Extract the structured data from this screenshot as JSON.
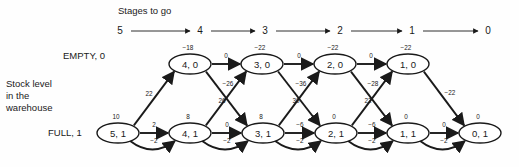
{
  "diagram": {
    "title": "Stages to go",
    "background_color": "#fefefe",
    "ink_color": "#1a1a1a",
    "row_labels": {
      "top": "EMPTY, 0",
      "bottom": "FULL, 1",
      "axis_caption_line1": "Stock level",
      "axis_caption_line2": "in the",
      "axis_caption_line3": "warehouse"
    },
    "stage_scale": {
      "label": "Stages to go",
      "ticks": [
        "5",
        "4",
        "3",
        "2",
        "1",
        "0"
      ],
      "tick_x": [
        120,
        200,
        265,
        340,
        412,
        488
      ],
      "y": 31,
      "arrows": [
        {
          "x1": 131,
          "x2": 190
        },
        {
          "x1": 211,
          "x2": 255
        },
        {
          "x1": 276,
          "x2": 330
        },
        {
          "x1": 351,
          "x2": 402
        },
        {
          "x1": 423,
          "x2": 478
        }
      ]
    },
    "nodes": [
      {
        "id": "4,0",
        "label": "4, 0",
        "value": "−18",
        "x": 190,
        "y": 64,
        "row": "top"
      },
      {
        "id": "3,0",
        "label": "3, 0",
        "value": "−22",
        "x": 262,
        "y": 64,
        "row": "top"
      },
      {
        "id": "2,0",
        "label": "2, 0",
        "value": "−22",
        "x": 335,
        "y": 64,
        "row": "top"
      },
      {
        "id": "1,0",
        "label": "1, 0",
        "value": "−22",
        "x": 408,
        "y": 64,
        "row": "top"
      },
      {
        "id": "5,1",
        "label": "5, 1",
        "value": "10",
        "x": 118,
        "y": 133,
        "row": "bottom"
      },
      {
        "id": "4,1",
        "label": "4, 1",
        "value": "8",
        "x": 190,
        "y": 133,
        "row": "bottom"
      },
      {
        "id": "3,1",
        "label": "3, 1",
        "value": "8",
        "x": 263,
        "y": 133,
        "row": "bottom"
      },
      {
        "id": "2,1",
        "label": "2, 1",
        "value": "0",
        "x": 336,
        "y": 133,
        "row": "bottom"
      },
      {
        "id": "1,1",
        "label": "1, 1",
        "value": "0",
        "x": 408,
        "y": 133,
        "row": "bottom"
      },
      {
        "id": "0,1",
        "label": "0, 1",
        "value": "0",
        "x": 480,
        "y": 133,
        "row": "bottom"
      }
    ],
    "node_rx": 21,
    "node_ry": 10,
    "edges_top": [
      {
        "from": "4,0",
        "to": "3,0",
        "label": "0",
        "lx": 226,
        "ly": 56
      },
      {
        "from": "3,0",
        "to": "2,0",
        "label": "0",
        "lx": 299,
        "ly": 56
      },
      {
        "from": "2,0",
        "to": "1,0",
        "label": "0",
        "lx": 371,
        "ly": 56
      }
    ],
    "edges_bottom_straight": [
      {
        "from": "5,1",
        "to": "4,1",
        "label": "2",
        "lx": 154,
        "ly": 125
      },
      {
        "from": "4,1",
        "to": "3,1",
        "label": "0",
        "lx": 227,
        "ly": 125
      },
      {
        "from": "3,1",
        "to": "2,1",
        "label": "−6",
        "lx": 300,
        "ly": 125
      },
      {
        "from": "2,1",
        "to": "1,1",
        "label": "−6",
        "lx": 372,
        "ly": 125
      },
      {
        "from": "1,1",
        "to": "0,1",
        "label": "0",
        "lx": 444,
        "ly": 125
      }
    ],
    "edges_bottom_curved": [
      {
        "from": "5,1",
        "to": "4,1",
        "label": "−2",
        "lx": 154,
        "ly": 141
      },
      {
        "from": "4,1",
        "to": "3,1",
        "label": "−2",
        "lx": 227,
        "ly": 141
      },
      {
        "from": "3,1",
        "to": "2,1",
        "label": "−2",
        "lx": 300,
        "ly": 141
      },
      {
        "from": "2,1",
        "to": "1,1",
        "label": "−2",
        "lx": 372,
        "ly": 141
      },
      {
        "from": "1,1",
        "to": "0,1",
        "label": "−2",
        "lx": 444,
        "ly": 141
      }
    ],
    "edges_up_diagonal": [
      {
        "from": "5,1",
        "to": "4,0",
        "label": "22",
        "lx": 149,
        "ly": 94
      },
      {
        "from": "4,1",
        "to": "3,0",
        "label": "26",
        "lx": 222,
        "ly": 101
      },
      {
        "from": "3,1",
        "to": "2,0",
        "label": "30",
        "lx": 296,
        "ly": 101
      },
      {
        "from": "2,1",
        "to": "1,0",
        "label": "22",
        "lx": 368,
        "ly": 101
      }
    ],
    "edges_down_diagonal": [
      {
        "from": "4,0",
        "to": "3,1",
        "label": "−26",
        "lx": 228,
        "ly": 84
      },
      {
        "from": "3,0",
        "to": "2,1",
        "label": "−36",
        "lx": 301,
        "ly": 84
      },
      {
        "from": "2,0",
        "to": "1,1",
        "label": "−28",
        "lx": 373,
        "ly": 84
      },
      {
        "from": "1,0",
        "to": "0,1",
        "label": "−22",
        "lx": 450,
        "ly": 93
      }
    ]
  }
}
